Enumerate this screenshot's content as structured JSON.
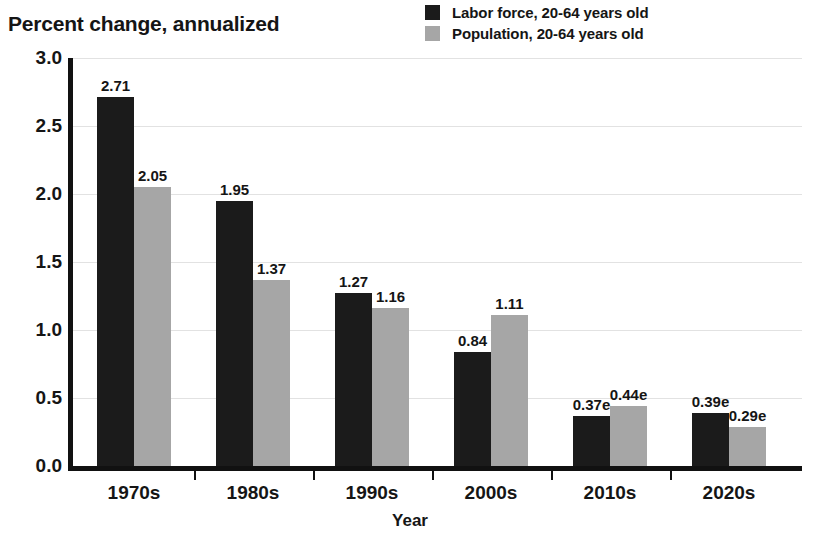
{
  "chart_data": {
    "type": "bar",
    "title": "Percent change, annualized",
    "xlabel": "Year",
    "ylabel": "",
    "categories": [
      "1970s",
      "1980s",
      "1990s",
      "2000s",
      "2010s",
      "2020s"
    ],
    "series": [
      {
        "name": "Labor force, 20-64 years old",
        "color": "#1b1b1b",
        "values": [
          2.71,
          1.95,
          1.27,
          0.84,
          0.37,
          0.39
        ],
        "labels": [
          "2.71",
          "1.95",
          "1.27",
          "0.84",
          "0.37e",
          "0.39e"
        ]
      },
      {
        "name": "Population, 20-64 years old",
        "color": "#a6a6a6",
        "values": [
          2.05,
          1.37,
          1.16,
          1.11,
          0.44,
          0.29
        ],
        "labels": [
          "2.05",
          "1.37",
          "1.16",
          "1.11",
          "0.44e",
          "0.29e"
        ]
      }
    ],
    "ylim": [
      0.0,
      3.0
    ],
    "yticks": [
      "0.0",
      "0.5",
      "1.0",
      "1.5",
      "2.0",
      "2.5",
      "3.0"
    ],
    "ytick_values": [
      0.0,
      0.5,
      1.0,
      1.5,
      2.0,
      2.5,
      3.0
    ],
    "grid": true,
    "legend_position": "top-right",
    "note": "e = estimated"
  },
  "legend": {
    "items": [
      {
        "label": "Labor force, 20-64 years old",
        "color": "#1b1b1b"
      },
      {
        "label": "Population, 20-64 years old",
        "color": "#a6a6a6"
      }
    ]
  }
}
